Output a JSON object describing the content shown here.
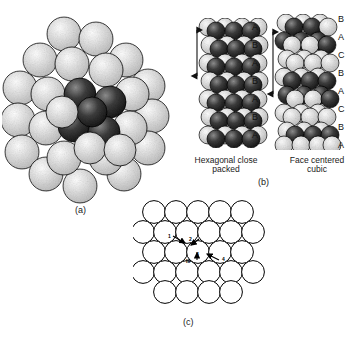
{
  "figure": {
    "panels": [
      {
        "id": "a",
        "letter": "(a)",
        "description": "three-dimensional cluster of close-packed spheres"
      },
      {
        "id": "b",
        "letter": "(b)",
        "description": "stacking sequences of close packed layers"
      },
      {
        "id": "c",
        "letter": "(c)",
        "description": "single close packed layer with interstitial sites"
      }
    ]
  },
  "panel_a": {
    "letter": "(a)"
  },
  "panel_b": {
    "letter": "(b)",
    "stacks": [
      {
        "name": "hcp",
        "caption_line1": "Hexagonal close",
        "caption_line2": "packed",
        "layers": [
          "A",
          "B",
          "A",
          "B",
          "A",
          "B",
          "A"
        ],
        "repeat_arrow": "unit-cell-height-arrow"
      },
      {
        "name": "fcc",
        "caption_line1": "Face centered",
        "caption_line2": "cubic",
        "layers": [
          "B",
          "A",
          "C",
          "B",
          "A",
          "C",
          "B",
          "A"
        ],
        "repeat_arrow": "unit-cell-height-arrow"
      }
    ]
  },
  "panel_c": {
    "letter": "(c)",
    "site_labels": [
      "1",
      "2",
      "3",
      "4"
    ],
    "center_label": "III"
  },
  "colors": {
    "ink": "#111111",
    "sphere_light": "#e9e9e9",
    "sphere_dark": "#2b2b2b",
    "outline": "#000000",
    "background": "#ffffff"
  }
}
